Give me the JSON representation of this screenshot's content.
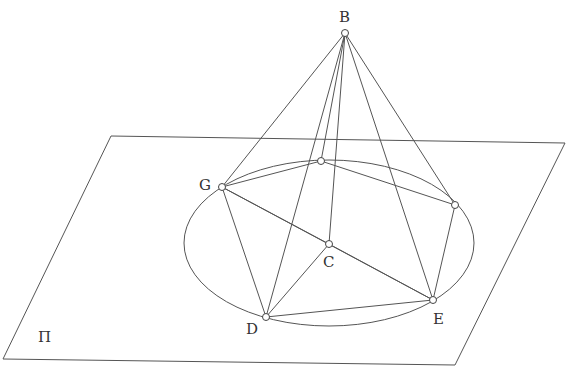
{
  "diagram": {
    "plane_label": "Π",
    "points": [
      {
        "id": "B",
        "label": "B"
      },
      {
        "id": "G",
        "label": "G"
      },
      {
        "id": "F",
        "label": ""
      },
      {
        "id": "H",
        "label": ""
      },
      {
        "id": "C",
        "label": "C"
      },
      {
        "id": "D",
        "label": "D"
      },
      {
        "id": "E",
        "label": "E"
      }
    ],
    "edges": [
      [
        "B",
        "G"
      ],
      [
        "B",
        "F"
      ],
      [
        "B",
        "H"
      ],
      [
        "B",
        "D"
      ],
      [
        "B",
        "E"
      ],
      [
        "B",
        "C"
      ],
      [
        "G",
        "F"
      ],
      [
        "F",
        "H"
      ],
      [
        "H",
        "E"
      ],
      [
        "E",
        "D"
      ],
      [
        "D",
        "G"
      ],
      [
        "G",
        "E"
      ],
      [
        "D",
        "C"
      ],
      [
        "C",
        "E"
      ],
      [
        "G",
        "C"
      ]
    ],
    "stroke_color": "#555555",
    "background": "#ffffff"
  }
}
